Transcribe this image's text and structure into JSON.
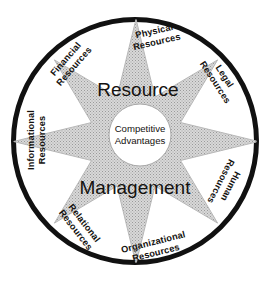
{
  "diagram": {
    "title_top": "Resource",
    "title_bottom": "Management",
    "center": {
      "line1": "Competitive",
      "line2": "Advantages"
    },
    "colors": {
      "ring_stroke": "#111111",
      "star_fill": "#bdbdbd",
      "star_stroke": "#bdbdbd",
      "background": "#ffffff",
      "text": "#14120f"
    },
    "geometry": {
      "ring_center_x": 135,
      "ring_center_y": 141,
      "ring_outer_radius": 124,
      "ring_thickness": 5,
      "star_points": 8,
      "star_outer_radius": 116,
      "star_inner_radius": 62,
      "center_circle_x": 140,
      "center_circle_y": 135,
      "center_circle_radius": 31
    },
    "resources": [
      {
        "id": "physical-resources",
        "line1": "Physical",
        "line2": "Resources",
        "x": 155,
        "y": 34,
        "rotation": -13
      },
      {
        "id": "legal-resources",
        "line1": "Legal",
        "line2": "Resources",
        "x": 222,
        "y": 78,
        "rotation": 57
      },
      {
        "id": "human-resources",
        "line1": "Human",
        "line2": "Resources",
        "x": 228,
        "y": 185,
        "rotation": 117
      },
      {
        "id": "organizational-resources",
        "line1": "Organizational",
        "line2": "Resources",
        "x": 154,
        "y": 245,
        "rotation": -14
      },
      {
        "id": "relational-resources",
        "line1": "Relational",
        "line2": "Resources",
        "x": 82,
        "y": 225,
        "rotation": 52
      },
      {
        "id": "informational-resources",
        "line1": "Informational",
        "line2": "Resources",
        "x": 34,
        "y": 140,
        "rotation": -90
      },
      {
        "id": "financial-resources",
        "line1": "Financial",
        "line2": "Resources",
        "x": 68,
        "y": 61,
        "rotation": -49
      }
    ],
    "resources_extra": [
      {
        "id": "physical-resources-dup",
        "line1": "Physical",
        "line2": "Resources"
      }
    ]
  }
}
